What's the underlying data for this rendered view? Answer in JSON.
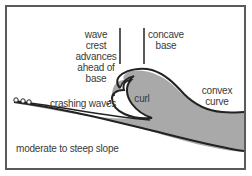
{
  "diagram": {
    "type": "plunging-breaker-wave",
    "colors": {
      "frame": "#5a5a5a",
      "wave_fill": "#a9a9a9",
      "outline": "#222222",
      "background": "#ffffff",
      "text": "#3a3a3a"
    },
    "labels": {
      "wave_crest_line1": "wave crest",
      "wave_crest_line2": "advances",
      "wave_crest_line3": "ahead of",
      "wave_crest_line4": "base",
      "concave_line1": "concave",
      "concave_line2": "base",
      "curl": "curl",
      "convex_line1": "convex",
      "convex_line2": "curve",
      "crashing_waves": "crashing waves",
      "slope": "moderate to steep slope"
    }
  }
}
